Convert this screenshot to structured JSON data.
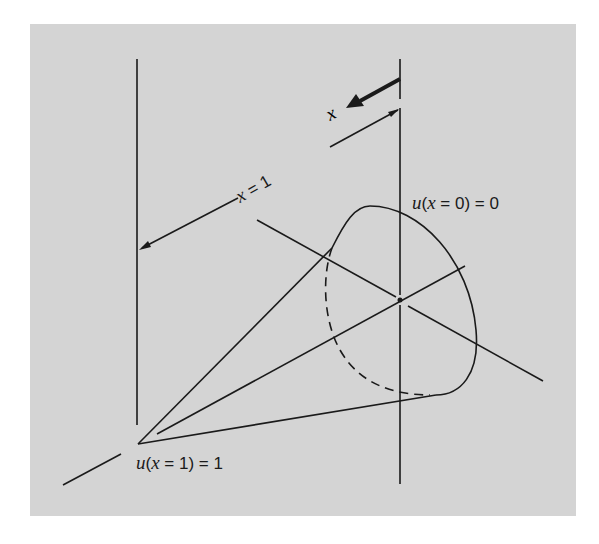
{
  "figure": {
    "background_color": "#d4d4d4",
    "line_color": "#1a1a1a",
    "labels": {
      "direction_x": "x",
      "length_prefix": "x",
      "length_suffix": " = 1",
      "bc_left_u": "u",
      "bc_left_open": "(",
      "bc_left_x": "x",
      "bc_left_rest": " = 0) = 0",
      "bc_right_u": "u",
      "bc_right_open": "(",
      "bc_right_x": "x",
      "bc_right_rest": " = 1) = 1"
    }
  }
}
